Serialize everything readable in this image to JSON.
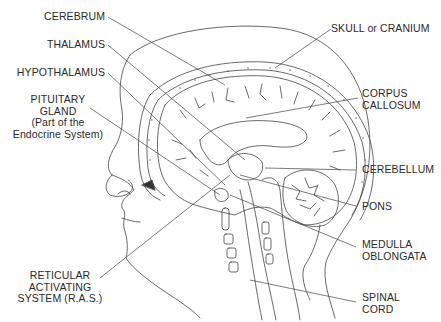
{
  "diagram": {
    "labels": {
      "cerebrum": {
        "lines": [
          "CEREBRUM"
        ]
      },
      "thalamus": {
        "lines": [
          "THALAMUS"
        ]
      },
      "hypothalamus": {
        "lines": [
          "HYPOTHALAMUS"
        ]
      },
      "pituitary": {
        "lines": [
          "PITUITARY",
          "GLAND",
          "(Part of the",
          "Endocrine System)"
        ]
      },
      "ras": {
        "lines": [
          "RETICULAR",
          "ACTIVATING",
          "SYSTEM (R.A.S.)"
        ]
      },
      "skull": {
        "lines": [
          "SKULL or CRANIUM"
        ]
      },
      "corpus": {
        "lines": [
          "CORPUS",
          "CALLOSUM"
        ]
      },
      "cerebellum": {
        "lines": [
          "CEREBELLUM"
        ]
      },
      "pons": {
        "lines": [
          "PONS"
        ]
      },
      "medulla": {
        "lines": [
          "MEDULLA",
          "OBLONGATA"
        ]
      },
      "spinal": {
        "lines": [
          "SPINAL",
          "CORD"
        ]
      }
    },
    "colors": {
      "ink": "#3a3a3a",
      "background": "#ffffff"
    }
  }
}
